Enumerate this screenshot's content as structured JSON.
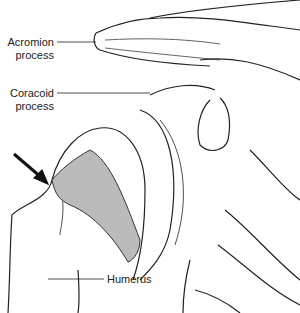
{
  "labels": {
    "acromion_line1": "Acromion",
    "acromion_line2": "process",
    "coracoid_line1": "Coracoid",
    "coracoid_line2": "process",
    "humerus": "Humerus"
  },
  "colors": {
    "line": "#222222",
    "lesion": "#bbbbbb",
    "arrow": "#111111"
  }
}
